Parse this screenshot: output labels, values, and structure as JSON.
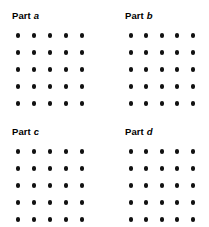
{
  "figure": {
    "background_color": "#ffffff",
    "dot_color": "#111111",
    "panels": [
      {
        "id": "a",
        "label_word": "Part",
        "label_letter": "a",
        "rows": 5,
        "columns": 5,
        "dot_count": 25
      },
      {
        "id": "b",
        "label_word": "Part",
        "label_letter": "b",
        "rows": 5,
        "columns": 5,
        "dot_count": 25
      },
      {
        "id": "c",
        "label_word": "Part",
        "label_letter": "c",
        "rows": 5,
        "columns": 5,
        "dot_count": 25
      },
      {
        "id": "d",
        "label_word": "Part",
        "label_letter": "d",
        "rows": 5,
        "columns": 5,
        "dot_count": 25
      }
    ]
  }
}
